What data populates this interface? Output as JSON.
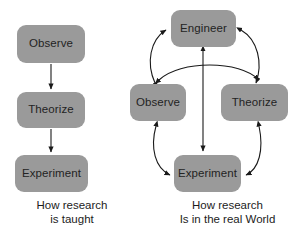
{
  "figure": {
    "width": 302,
    "height": 242,
    "background_color": "#ffffff",
    "node_fill_color": "#9a9a9a",
    "node_text_color": "#232323",
    "arrow_color": "#1a1a1a"
  },
  "panels": [
    {
      "id": "how-research-is-taught",
      "caption_line1": "How research",
      "caption_line2": "is taught",
      "nodes": [
        {
          "id": "left-observe",
          "label": "Observe"
        },
        {
          "id": "left-theorize",
          "label": "Theorize"
        },
        {
          "id": "left-experiment",
          "label": "Experiment"
        }
      ],
      "edges": [
        {
          "from": "left-observe",
          "to": "left-theorize",
          "style": "straight",
          "heads": "single"
        },
        {
          "from": "left-theorize",
          "to": "left-experiment",
          "style": "straight",
          "heads": "single"
        }
      ]
    },
    {
      "id": "how-research-is-in-the-real-world",
      "caption_line1": "How  research",
      "caption_line2": "Is in the real World",
      "nodes": [
        {
          "id": "right-engineer",
          "label": "Engineer"
        },
        {
          "id": "right-observe",
          "label": "Observe"
        },
        {
          "id": "right-theorize",
          "label": "Theorize"
        },
        {
          "id": "right-experiment",
          "label": "Experiment"
        }
      ],
      "edges": [
        {
          "from": "right-observe",
          "to": "right-engineer",
          "style": "curved",
          "heads": "double"
        },
        {
          "from": "right-engineer",
          "to": "right-theorize",
          "style": "curved",
          "heads": "double"
        },
        {
          "from": "right-observe",
          "to": "right-theorize",
          "style": "curved",
          "heads": "double"
        },
        {
          "from": "right-observe",
          "to": "right-experiment",
          "style": "curved",
          "heads": "double"
        },
        {
          "from": "right-theorize",
          "to": "right-experiment",
          "style": "curved",
          "heads": "double"
        },
        {
          "from": "right-engineer",
          "to": "right-experiment",
          "style": "straight",
          "heads": "double"
        }
      ]
    }
  ]
}
